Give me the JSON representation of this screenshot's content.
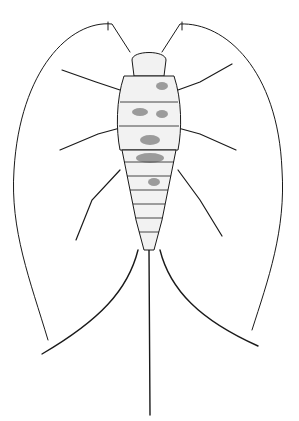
{
  "image": {
    "subject": "silverfish illustration",
    "style": "black ink scientific drawing on white",
    "colors": {
      "background": "#ffffff",
      "ink": "#1a1a1a",
      "shade": "#555555"
    }
  },
  "caption": {
    "text": ""
  }
}
